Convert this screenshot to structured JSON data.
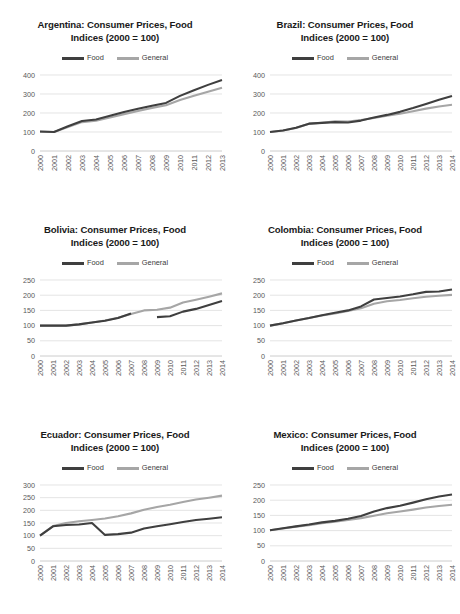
{
  "figure": {
    "title_suffix": "Consumer Prices, Food",
    "subtitle": "Indices (2000 = 100)",
    "legend": [
      {
        "label": "Food",
        "color": "#3f3f3f"
      },
      {
        "label": "General",
        "color": "#a6a6a6"
      }
    ]
  },
  "chart_data": [
    {
      "type": "line",
      "title": "Argentina: Consumer Prices, Food",
      "subtitle": "Indices (2000 = 100)",
      "xlabel": "",
      "ylabel": "",
      "ylim": [
        0,
        400
      ],
      "yticks": [
        0,
        100,
        200,
        300,
        400
      ],
      "grid": true,
      "legend_position": "top-center",
      "categories": [
        "2000",
        "2001",
        "2002",
        "2003",
        "2004",
        "2005",
        "2006",
        "2007",
        "2008",
        "2009",
        "2010",
        "2011",
        "2012",
        "2013"
      ],
      "series": [
        {
          "name": "Food",
          "color": "#3f3f3f",
          "values": [
            103,
            100,
            130,
            158,
            166,
            185,
            205,
            222,
            238,
            253,
            290,
            320,
            348,
            374
          ]
        },
        {
          "name": "General",
          "color": "#a6a6a6",
          "values": [
            101,
            100,
            126,
            152,
            160,
            176,
            194,
            211,
            227,
            241,
            268,
            291,
            312,
            333
          ]
        }
      ]
    },
    {
      "type": "line",
      "title": "Brazil: Consumer Prices, Food",
      "subtitle": "Indices (2000 = 100)",
      "xlabel": "",
      "ylabel": "",
      "ylim": [
        0,
        400
      ],
      "yticks": [
        0,
        100,
        200,
        300,
        400
      ],
      "grid": true,
      "legend_position": "top-center",
      "categories": [
        "2000",
        "2001",
        "2002",
        "2003",
        "2004",
        "2005",
        "2006",
        "2007",
        "2008",
        "2009",
        "2010",
        "2011",
        "2012",
        "2013",
        "2014"
      ],
      "series": [
        {
          "name": "Food",
          "color": "#3f3f3f",
          "values": [
            100,
            108,
            122,
            144,
            148,
            152,
            150,
            160,
            176,
            190,
            206,
            226,
            248,
            270,
            290
          ]
        },
        {
          "name": "General",
          "color": "#a6a6a6",
          "values": [
            100,
            108,
            121,
            143,
            149,
            156,
            155,
            163,
            174,
            186,
            196,
            209,
            223,
            234,
            243
          ]
        }
      ]
    },
    {
      "type": "line",
      "title": "Bolivia: Consumer Prices, Food",
      "subtitle": "Indices (2000 = 100)",
      "xlabel": "",
      "ylabel": "",
      "ylim": [
        0,
        250
      ],
      "yticks": [
        0,
        50,
        100,
        150,
        200,
        250
      ],
      "grid": true,
      "legend_position": "top-center",
      "categories": [
        "2000",
        "2001",
        "2002",
        "2003",
        "2004",
        "2005",
        "2006",
        "2007",
        "2008",
        "2009",
        "2010",
        "2011",
        "2012",
        "2013",
        "2014"
      ],
      "series": [
        {
          "name": "Food",
          "color": "#3f3f3f",
          "values": [
            100,
            100,
            100,
            104,
            110,
            116,
            125,
            140,
            null,
            128,
            131,
            146,
            155,
            168,
            181
          ]
        },
        {
          "name": "General",
          "color": "#a6a6a6",
          "values": [
            100,
            100,
            100,
            104,
            110,
            117,
            126,
            138,
            150,
            152,
            159,
            176,
            185,
            195,
            206
          ]
        }
      ]
    },
    {
      "type": "line",
      "title": "Colombia: Consumer Prices, Food",
      "subtitle": "Indices (2000 = 100)",
      "xlabel": "",
      "ylabel": "",
      "ylim": [
        0,
        250
      ],
      "yticks": [
        0,
        50,
        100,
        150,
        200,
        250
      ],
      "grid": true,
      "legend_position": "top-center",
      "categories": [
        "2000",
        "2001",
        "2002",
        "2003",
        "2004",
        "2005",
        "2006",
        "2007",
        "2008",
        "2009",
        "2010",
        "2011",
        "2012",
        "2013",
        "2014"
      ],
      "series": [
        {
          "name": "Food",
          "color": "#3f3f3f",
          "values": [
            100,
            108,
            117,
            125,
            134,
            142,
            150,
            163,
            186,
            191,
            196,
            203,
            211,
            212,
            219
          ]
        },
        {
          "name": "General",
          "color": "#a6a6a6",
          "values": [
            100,
            108,
            117,
            125,
            133,
            140,
            148,
            157,
            172,
            180,
            184,
            190,
            195,
            198,
            201
          ]
        }
      ]
    },
    {
      "type": "line",
      "title": "Ecuador: Consumer Prices, Food",
      "subtitle": "Indices (2000 = 100)",
      "xlabel": "",
      "ylabel": "",
      "ylim": [
        0,
        300
      ],
      "yticks": [
        0,
        50,
        100,
        150,
        200,
        250,
        300
      ],
      "grid": true,
      "legend_position": "top-center",
      "categories": [
        "2000",
        "2001",
        "2002",
        "2003",
        "2004",
        "2005",
        "2006",
        "2007",
        "2008",
        "2009",
        "2010",
        "2011",
        "2012",
        "2013",
        "2014"
      ],
      "series": [
        {
          "name": "Food",
          "color": "#3f3f3f",
          "values": [
            100,
            137,
            142,
            144,
            150,
            103,
            106,
            112,
            128,
            137,
            145,
            154,
            162,
            167,
            173
          ]
        },
        {
          "name": "General",
          "color": "#a6a6a6",
          "values": [
            100,
            138,
            150,
            157,
            162,
            168,
            177,
            188,
            202,
            213,
            222,
            233,
            243,
            250,
            258
          ]
        }
      ]
    },
    {
      "type": "line",
      "title": "Mexico: Consumer Prices, Food",
      "subtitle": "Indices (2000 = 100)",
      "xlabel": "",
      "ylabel": "",
      "ylim": [
        0,
        250
      ],
      "yticks": [
        0,
        50,
        100,
        150,
        200,
        250
      ],
      "grid": true,
      "legend_position": "top-center",
      "categories": [
        "2000",
        "2001",
        "2002",
        "2003",
        "2004",
        "2005",
        "2006",
        "2007",
        "2008",
        "2009",
        "2010",
        "2011",
        "2012",
        "2013",
        "2014"
      ],
      "series": [
        {
          "name": "Food",
          "color": "#3f3f3f",
          "values": [
            101,
            108,
            114,
            120,
            127,
            132,
            139,
            148,
            163,
            174,
            182,
            192,
            203,
            212,
            219
          ]
        },
        {
          "name": "General",
          "color": "#a6a6a6",
          "values": [
            101,
            107,
            113,
            118,
            124,
            129,
            135,
            141,
            149,
            157,
            163,
            169,
            176,
            181,
            185
          ]
        }
      ]
    }
  ]
}
